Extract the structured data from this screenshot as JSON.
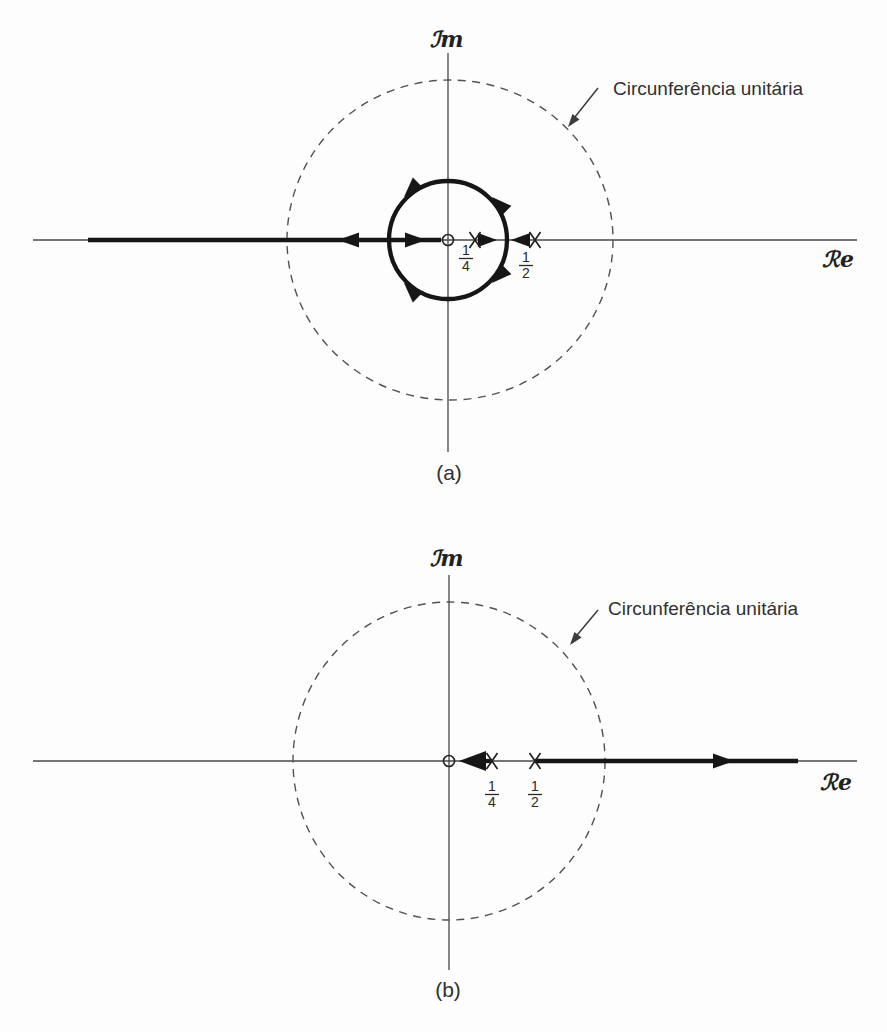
{
  "figure_kind": "z-plane root-locus diagrams",
  "colors": {
    "ink": "#161616",
    "axis": "#474747",
    "dashed_circle": "#515151",
    "text": "#303030",
    "background": "#fdfdfd"
  },
  "panels": [
    {
      "caption": "(a)",
      "imaginary_axis_label": "ℐm",
      "real_axis_label": "ℛe",
      "unit_circle_label": "Circunferência unitária",
      "zero": {
        "marker": "small circle",
        "position": "origin"
      },
      "poles": [
        {
          "marker": "x",
          "numerator": "1",
          "denominator": "4"
        },
        {
          "marker": "x",
          "numerator": "1",
          "denominator": "2"
        }
      ],
      "locus_note": "Thick branches: arrows leave poles 1/4 and 1/2 toward breakaway point, travel around a circle about the origin (arrows at four quadrants), then along the negative real axis — one arrow into the zero at the origin, one arrow toward minus infinity."
    },
    {
      "caption": "(b)",
      "imaginary_axis_label": "ℐm",
      "real_axis_label": "ℛe",
      "unit_circle_label": "Circunferência unitária",
      "zero": {
        "marker": "small circle",
        "position": "origin"
      },
      "poles": [
        {
          "marker": "x",
          "numerator": "1",
          "denominator": "4"
        },
        {
          "marker": "x",
          "numerator": "1",
          "denominator": "2"
        }
      ],
      "locus_note": "Thick branches on the real axis: arrow from pole 1/4 pointing left into the zero at the origin; thick segment from pole 1/2 with arrow pointing right toward plus infinity."
    }
  ]
}
